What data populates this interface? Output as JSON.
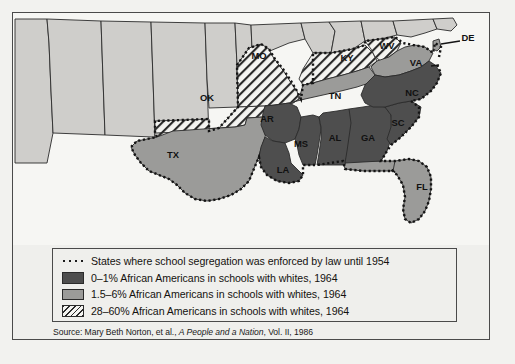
{
  "figure": {
    "kind": "thematic-choropleth-map",
    "region": "Southern and border United States"
  },
  "map": {
    "state_labels": [
      {
        "code": "MO",
        "x": 246,
        "y": 46,
        "category": "28-60"
      },
      {
        "code": "OK",
        "x": 194,
        "y": 88,
        "category": "28-60"
      },
      {
        "code": "KY",
        "x": 334,
        "y": 48,
        "category": "28-60"
      },
      {
        "code": "WV",
        "x": 374,
        "y": 36,
        "category": "28-60"
      },
      {
        "code": "VA",
        "x": 403,
        "y": 53,
        "category": "1.5-6"
      },
      {
        "code": "TN",
        "x": 322,
        "y": 86,
        "category": "1.5-6"
      },
      {
        "code": "NC",
        "x": 399,
        "y": 83,
        "category": "0-1"
      },
      {
        "code": "SC",
        "x": 385,
        "y": 113,
        "category": "0-1"
      },
      {
        "code": "GA",
        "x": 355,
        "y": 128,
        "category": "0-1"
      },
      {
        "code": "AL",
        "x": 322,
        "y": 128,
        "category": "0-1"
      },
      {
        "code": "MS",
        "x": 288,
        "y": 134,
        "category": "0-1"
      },
      {
        "code": "AR",
        "x": 254,
        "y": 109,
        "category": "0-1"
      },
      {
        "code": "LA",
        "x": 270,
        "y": 160,
        "category": "0-1"
      },
      {
        "code": "TX",
        "x": 160,
        "y": 145,
        "category": "1.5-6"
      },
      {
        "code": "FL",
        "x": 409,
        "y": 177,
        "category": "1.5-6"
      },
      {
        "code": "DE",
        "x": 455,
        "y": 28,
        "category": "1.5-6"
      }
    ],
    "colors": {
      "dark_0_1": "#4e4e4e",
      "medium_1_5_6": "#9b9b99",
      "hatch_28_60": "#f4f4f1",
      "non_subject_states": "#cfcecb",
      "water": "#f6f6f3",
      "outline": "#2b2b2b",
      "segregation_boundary": "#141414"
    }
  },
  "legend": {
    "rows": [
      {
        "swatch": "dotted-boundary-swatch",
        "label": "States where school segregation was enforced by law until 1954"
      },
      {
        "swatch": "dark-gray-swatch",
        "label": "0–1% African Americans in schools with whites, 1964"
      },
      {
        "swatch": "medium-gray-swatch",
        "label": "1.5–6% African Americans in schools with whites, 1964"
      },
      {
        "swatch": "hatched-swatch",
        "label": "28–60% African Americans in schools with whites, 1964"
      }
    ]
  },
  "source": {
    "prefix": "Source: Mary Beth Norton, et al., ",
    "title": "A People and a Nation",
    "suffix": ", Vol. II, 1986"
  }
}
